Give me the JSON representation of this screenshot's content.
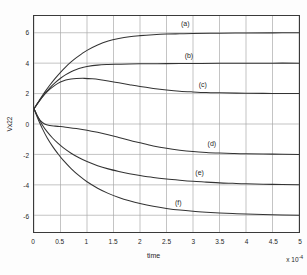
{
  "chart_data": {
    "type": "line",
    "title": "",
    "subtitle": "",
    "xlabel": "time",
    "ylabel": "Vx22",
    "x_exponent_text": "x 10",
    "x_exponent_power": "-4",
    "xlim": [
      0,
      5
    ],
    "ylim": [
      -7.1,
      7.1
    ],
    "xticks": [
      "0",
      "0.5",
      "1",
      "1.5",
      "2",
      "2.5",
      "3",
      "3.5",
      "4",
      "4.5",
      "5"
    ],
    "xtick_values": [
      0,
      0.5,
      1,
      1.5,
      2,
      2.5,
      3,
      3.5,
      4,
      4.5,
      5
    ],
    "yticks": [
      "6",
      "4",
      "2",
      "0",
      "-2",
      "-4",
      "-6"
    ],
    "ytick_values": [
      6,
      4,
      2,
      0,
      -2,
      -4,
      -6
    ],
    "grid": true,
    "grid_color": "#a9a9a9",
    "axis_color": "#3a3a3a",
    "curve_color": "#333333",
    "legend_position": "inline-annotations",
    "initial_value": 1,
    "series": [
      {
        "name": "(a)",
        "label": "(a)",
        "final_value": 6,
        "peak_value": 6,
        "annotation_x": 2.85,
        "annotation_y": 6.55,
        "points": [
          [
            0.0,
            1.0
          ],
          [
            0.1,
            1.55
          ],
          [
            0.2,
            2.08
          ],
          [
            0.3,
            2.56
          ],
          [
            0.4,
            3.0
          ],
          [
            0.5,
            3.4
          ],
          [
            0.6,
            3.76
          ],
          [
            0.7,
            4.08
          ],
          [
            0.8,
            4.36
          ],
          [
            0.9,
            4.61
          ],
          [
            1.0,
            4.84
          ],
          [
            1.2,
            5.19
          ],
          [
            1.4,
            5.45
          ],
          [
            1.6,
            5.62
          ],
          [
            1.8,
            5.74
          ],
          [
            2.0,
            5.81
          ],
          [
            2.25,
            5.87
          ],
          [
            2.5,
            5.91
          ],
          [
            2.75,
            5.93
          ],
          [
            3.0,
            5.95
          ],
          [
            3.5,
            5.97
          ],
          [
            4.0,
            5.98
          ],
          [
            4.5,
            5.99
          ],
          [
            5.0,
            6.0
          ]
        ]
      },
      {
        "name": "(b)",
        "label": "(b)",
        "final_value": 4,
        "peak_value": 4,
        "annotation_x": 2.92,
        "annotation_y": 4.52,
        "points": [
          [
            0.0,
            1.0
          ],
          [
            0.1,
            1.52
          ],
          [
            0.2,
            1.98
          ],
          [
            0.3,
            2.38
          ],
          [
            0.4,
            2.72
          ],
          [
            0.5,
            3.01
          ],
          [
            0.6,
            3.25
          ],
          [
            0.7,
            3.44
          ],
          [
            0.8,
            3.59
          ],
          [
            0.9,
            3.7
          ],
          [
            1.0,
            3.78
          ],
          [
            1.2,
            3.87
          ],
          [
            1.4,
            3.91
          ],
          [
            1.6,
            3.93
          ],
          [
            1.8,
            3.95
          ],
          [
            2.0,
            3.96
          ],
          [
            2.5,
            3.97
          ],
          [
            3.0,
            3.98
          ],
          [
            3.5,
            3.99
          ],
          [
            4.0,
            3.99
          ],
          [
            4.5,
            4.0
          ],
          [
            5.0,
            4.0
          ]
        ]
      },
      {
        "name": "(c)",
        "label": "(c)",
        "final_value": 2,
        "peak_value": 3.0,
        "peak_x": 0.95,
        "annotation_x": 3.18,
        "annotation_y": 2.58,
        "points": [
          [
            0.0,
            1.0
          ],
          [
            0.1,
            1.5
          ],
          [
            0.2,
            1.94
          ],
          [
            0.3,
            2.29
          ],
          [
            0.4,
            2.56
          ],
          [
            0.5,
            2.76
          ],
          [
            0.6,
            2.89
          ],
          [
            0.7,
            2.96
          ],
          [
            0.8,
            2.99
          ],
          [
            0.95,
            3.0
          ],
          [
            1.1,
            2.97
          ],
          [
            1.25,
            2.91
          ],
          [
            1.4,
            2.83
          ],
          [
            1.6,
            2.71
          ],
          [
            1.8,
            2.58
          ],
          [
            2.0,
            2.46
          ],
          [
            2.25,
            2.34
          ],
          [
            2.5,
            2.24
          ],
          [
            2.75,
            2.16
          ],
          [
            3.0,
            2.11
          ],
          [
            3.25,
            2.07
          ],
          [
            3.5,
            2.05
          ],
          [
            4.0,
            2.02
          ],
          [
            4.5,
            2.01
          ],
          [
            5.0,
            2.0
          ]
        ]
      },
      {
        "name": "(d)",
        "label": "(d)",
        "final_value": -2,
        "peak_value": -2,
        "annotation_x": 3.35,
        "annotation_y": -1.22,
        "points": [
          [
            0.0,
            1.0
          ],
          [
            0.06,
            0.55
          ],
          [
            0.12,
            0.22
          ],
          [
            0.2,
            0.0
          ],
          [
            0.3,
            -0.1
          ],
          [
            0.4,
            -0.14
          ],
          [
            0.5,
            -0.17
          ],
          [
            0.6,
            -0.21
          ],
          [
            0.8,
            -0.3
          ],
          [
            1.0,
            -0.41
          ],
          [
            1.2,
            -0.55
          ],
          [
            1.4,
            -0.71
          ],
          [
            1.6,
            -0.89
          ],
          [
            1.8,
            -1.07
          ],
          [
            2.0,
            -1.24
          ],
          [
            2.25,
            -1.44
          ],
          [
            2.5,
            -1.6
          ],
          [
            2.75,
            -1.72
          ],
          [
            3.0,
            -1.81
          ],
          [
            3.25,
            -1.87
          ],
          [
            3.5,
            -1.91
          ],
          [
            3.75,
            -1.94
          ],
          [
            4.0,
            -1.96
          ],
          [
            4.5,
            -1.98
          ],
          [
            5.0,
            -2.0
          ]
        ]
      },
      {
        "name": "(e)",
        "label": "(e)",
        "final_value": -4,
        "peak_value": -4,
        "annotation_x": 3.12,
        "annotation_y": -3.12,
        "points": [
          [
            0.0,
            1.0
          ],
          [
            0.08,
            0.42
          ],
          [
            0.16,
            -0.08
          ],
          [
            0.25,
            -0.52
          ],
          [
            0.35,
            -0.92
          ],
          [
            0.45,
            -1.26
          ],
          [
            0.55,
            -1.55
          ],
          [
            0.7,
            -1.92
          ],
          [
            0.85,
            -2.22
          ],
          [
            1.0,
            -2.47
          ],
          [
            1.2,
            -2.74
          ],
          [
            1.4,
            -2.95
          ],
          [
            1.6,
            -3.12
          ],
          [
            1.8,
            -3.27
          ],
          [
            2.0,
            -3.39
          ],
          [
            2.25,
            -3.52
          ],
          [
            2.5,
            -3.62
          ],
          [
            2.75,
            -3.7
          ],
          [
            3.0,
            -3.77
          ],
          [
            3.25,
            -3.82
          ],
          [
            3.5,
            -3.87
          ],
          [
            3.75,
            -3.9
          ],
          [
            4.0,
            -3.93
          ],
          [
            4.5,
            -3.97
          ],
          [
            5.0,
            -4.0
          ]
        ]
      },
      {
        "name": "(f)",
        "label": "(f)",
        "final_value": -6,
        "peak_value": -6,
        "annotation_x": 2.72,
        "annotation_y": -5.1,
        "points": [
          [
            0.0,
            1.0
          ],
          [
            0.08,
            0.3
          ],
          [
            0.16,
            -0.32
          ],
          [
            0.25,
            -0.92
          ],
          [
            0.35,
            -1.47
          ],
          [
            0.45,
            -1.95
          ],
          [
            0.55,
            -2.38
          ],
          [
            0.7,
            -2.93
          ],
          [
            0.85,
            -3.4
          ],
          [
            1.0,
            -3.8
          ],
          [
            1.2,
            -4.22
          ],
          [
            1.4,
            -4.56
          ],
          [
            1.6,
            -4.83
          ],
          [
            1.8,
            -5.05
          ],
          [
            2.0,
            -5.23
          ],
          [
            2.25,
            -5.41
          ],
          [
            2.5,
            -5.55
          ],
          [
            2.75,
            -5.66
          ],
          [
            3.0,
            -5.74
          ],
          [
            3.25,
            -5.8
          ],
          [
            3.5,
            -5.85
          ],
          [
            3.75,
            -5.89
          ],
          [
            4.0,
            -5.92
          ],
          [
            4.5,
            -5.97
          ],
          [
            5.0,
            -6.0
          ]
        ]
      }
    ]
  }
}
